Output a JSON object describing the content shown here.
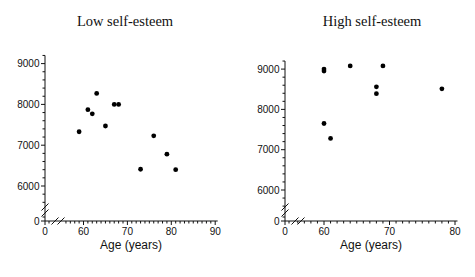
{
  "figure": {
    "background_color": "#ffffff",
    "text_color": "#111111",
    "point_color": "#000000"
  },
  "chart_data": [
    {
      "type": "scatter",
      "title": "Low self-esteem",
      "xlabel": "Age (years)",
      "ylabel": "",
      "x_tick_labels": [
        0,
        60,
        70,
        80,
        90
      ],
      "y_tick_labels": [
        0,
        6000,
        7000,
        8000,
        9000
      ],
      "x_axis_break_between": [
        0,
        60
      ],
      "y_axis_break_between": [
        0,
        6000
      ],
      "x_minor_tick_step": 1,
      "y_minor_tick_step": 200,
      "xlim": [
        56,
        90
      ],
      "ylim": [
        5600,
        9200
      ],
      "legend": "none",
      "grid": false,
      "points": [
        {
          "age": 59,
          "score": 7330
        },
        {
          "age": 61,
          "score": 7870
        },
        {
          "age": 62,
          "score": 7770
        },
        {
          "age": 63,
          "score": 8270
        },
        {
          "age": 65,
          "score": 7470
        },
        {
          "age": 67,
          "score": 8000
        },
        {
          "age": 68,
          "score": 8000
        },
        {
          "age": 73,
          "score": 6410
        },
        {
          "age": 76,
          "score": 7230
        },
        {
          "age": 79,
          "score": 6780
        },
        {
          "age": 81,
          "score": 6400
        }
      ]
    },
    {
      "type": "scatter",
      "title": "High self-esteem",
      "xlabel": "Age (years)",
      "ylabel": "",
      "x_tick_labels": [
        0,
        60,
        70,
        80
      ],
      "y_tick_labels": [
        0,
        6000,
        7000,
        8000,
        9000
      ],
      "x_axis_break_between": [
        0,
        60
      ],
      "y_axis_break_between": [
        0,
        6000
      ],
      "x_minor_tick_step": 1,
      "y_minor_tick_step": 200,
      "xlim": [
        56,
        80
      ],
      "ylim": [
        5600,
        9200
      ],
      "legend": "none",
      "grid": false,
      "points": [
        {
          "age": 60,
          "score": 9000
        },
        {
          "age": 60,
          "score": 8950
        },
        {
          "age": 64,
          "score": 9080
        },
        {
          "age": 69,
          "score": 9080
        },
        {
          "age": 68,
          "score": 8560
        },
        {
          "age": 68,
          "score": 8390
        },
        {
          "age": 78,
          "score": 8510
        },
        {
          "age": 60,
          "score": 7650
        },
        {
          "age": 61,
          "score": 7280
        }
      ]
    }
  ]
}
